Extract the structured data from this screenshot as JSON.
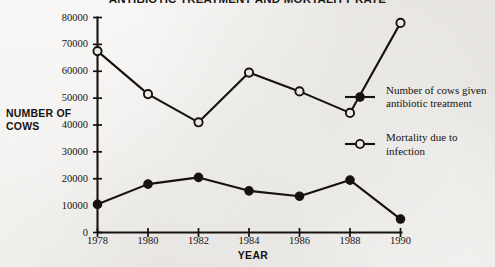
{
  "chart_data": {
    "type": "line",
    "title": "ANTIBIOTIC TREATMENT AND MORTALITY RATE",
    "xlabel": "YEAR",
    "ylabel": "NUMBER OF COWS",
    "categories": [
      1978,
      1980,
      1982,
      1984,
      1986,
      1988,
      1990
    ],
    "x_tick_labels": [
      "1978",
      "1980",
      "1982",
      "1984",
      "1986",
      "1988",
      "1990"
    ],
    "y_tick_labels": [
      "0",
      "10000",
      "20000",
      "30000",
      "40000",
      "50000",
      "60000",
      "70000",
      "80000"
    ],
    "y_ticks": [
      0,
      10000,
      20000,
      30000,
      40000,
      50000,
      60000,
      70000,
      80000
    ],
    "ylim": [
      0,
      80000
    ],
    "xlim": [
      1978,
      1990
    ],
    "grid": false,
    "legend_position": "right",
    "series": [
      {
        "name": "Number of cows given antibiotic treatment",
        "marker": "filled-circle",
        "color": "#16120f",
        "values": [
          10500,
          18000,
          20500,
          15500,
          13500,
          19500,
          5000
        ]
      },
      {
        "name": "Mortality due to infection",
        "marker": "open-circle",
        "color": "#16120f",
        "values": [
          67500,
          51500,
          41000,
          59500,
          52500,
          44500,
          78000
        ]
      }
    ]
  },
  "legend": {
    "entries": [
      {
        "label": "Number of cows given antibiotic treatment",
        "marker": "filled-circle"
      },
      {
        "label": "Mortality due to infection",
        "marker": "open-circle"
      }
    ]
  },
  "colors": {
    "ink": "#16120f",
    "paper": "#eceae6"
  }
}
